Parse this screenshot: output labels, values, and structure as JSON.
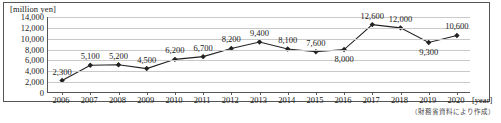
{
  "unit_caption": "[million yen]",
  "x_axis_caption": "[year]",
  "source_note": "（財務省資料により作成）",
  "chart_data": {
    "type": "line",
    "title": "",
    "xlabel": "[year]",
    "ylabel": "[million yen]",
    "ylim": [
      0,
      14000
    ],
    "ytick_step": 2000,
    "yticks": [
      "0",
      "2,000",
      "4,000",
      "6,000",
      "8,000",
      "10,000",
      "12,000",
      "14,000"
    ],
    "ytick_values": [
      0,
      2000,
      4000,
      6000,
      8000,
      10000,
      12000,
      14000
    ],
    "grid": true,
    "legend": "none",
    "marker": "diamond",
    "line_color": "#222222",
    "grid_color": "#c9c9c9",
    "axis_color": "#555555",
    "categories": [
      "2006",
      "2007",
      "2008",
      "2009",
      "2010",
      "2011",
      "2012",
      "2013",
      "2014",
      "2015",
      "2016",
      "2017",
      "2018",
      "2019",
      "2020"
    ],
    "values": [
      2300,
      5100,
      5200,
      4500,
      6200,
      6700,
      8200,
      9400,
      8100,
      7600,
      8000,
      12600,
      12000,
      9300,
      10600
    ],
    "point_labels": [
      "2,300",
      "5,100",
      "5,200",
      "4,500",
      "6,200",
      "6,700",
      "8,200",
      "9,400",
      "8,100",
      "7,600",
      "8,000",
      "12,600",
      "12,000",
      "9,300",
      "10,600"
    ],
    "label_positions": [
      "above",
      "above",
      "above",
      "above",
      "above",
      "above",
      "above",
      "above",
      "above",
      "above",
      "below",
      "above",
      "above",
      "below",
      "above"
    ]
  }
}
